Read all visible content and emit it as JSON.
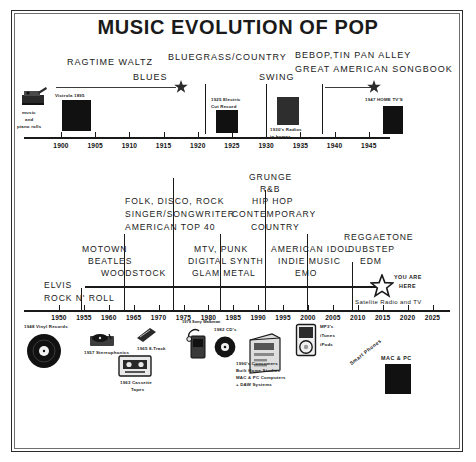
{
  "title": "MUSIC EVOLUTION OF POP",
  "chart_data": {
    "type": "timeline",
    "title": "MUSIC EVOLUTION OF POP",
    "grid": false,
    "legend": null,
    "timelines": [
      {
        "name": "early-era",
        "xlabel": "",
        "axis_ticks": [
          "1900",
          "1905",
          "1910",
          "1915",
          "1920",
          "1925",
          "1930",
          "1935",
          "1940",
          "1945"
        ],
        "xlim": [
          1895,
          1949
        ],
        "eras": [
          {
            "label": "RAGTIME WALTZ BLUES",
            "start": 1896,
            "end": 1920
          },
          {
            "label": "BLUEGRASS/COUNTRY",
            "start": 1920,
            "end": 1930
          },
          {
            "label": "SWING",
            "start": 1930,
            "end": 1939
          },
          {
            "label": "BEBOP,TIN PAN ALLEY GREAT AMERICAN SONGBOOK",
            "start": 1939,
            "end": 1948
          }
        ],
        "annotations": [
          {
            "label": "music and piano rolls",
            "year": 1895
          },
          {
            "label": "Victrola 1895",
            "year": 1897
          },
          {
            "label": "1925 Electric Cut Record",
            "year": 1925
          },
          {
            "label": "1930's Radios in homes",
            "year": 1933
          },
          {
            "label": "1947 HOME TV'S",
            "year": 1947
          }
        ]
      },
      {
        "name": "modern-era",
        "xlabel": "",
        "axis_ticks": [
          "1950",
          "1955",
          "1960",
          "1965",
          "1970",
          "1975",
          "1980",
          "1985",
          "1990",
          "1995",
          "2000",
          "2005",
          "2010",
          "2015",
          "2020",
          "2025"
        ],
        "xlim": [
          1947,
          2027
        ],
        "eras": [
          {
            "label": "ELVIS ROCK N' ROLL",
            "start": 1950,
            "end": 1957
          },
          {
            "label": "MOTOWN BEATLES WOODSTOCK",
            "start": 1957,
            "end": 1968
          },
          {
            "label": "FOLK, DISCO, ROCK SINGER/SONGWRITER AMERICAN TOP 40",
            "start": 1968,
            "end": 1977
          },
          {
            "label": "MTV, PUNK DIGITAL SYNTH GLAM METAL",
            "start": 1977,
            "end": 1988
          },
          {
            "label": "GRUNGE R&B HIP HOP CONTEMPORARY COUNTRY",
            "start": 1988,
            "end": 1999
          },
          {
            "label": "AMERICAN IDOL INDIE MUSIC EMO",
            "start": 1999,
            "end": 2010
          },
          {
            "label": "REGGAETONE DUBSTEP EDM",
            "start": 2010,
            "end": 2025
          }
        ],
        "annotations": [
          {
            "label": "1948 Vinyl Records",
            "year": 1948
          },
          {
            "label": "1957 Stereophonics",
            "year": 1957
          },
          {
            "label": "1963 Cassette Tapes",
            "year": 1963
          },
          {
            "label": "1965 8-Track",
            "year": 1965
          },
          {
            "label": "1979 Sony Walkman",
            "year": 1979
          },
          {
            "label": "1982 CD's",
            "year": 1982
          },
          {
            "label": "1990's Consumers Built Home Studios MAC & PC Computers + DAW Systems",
            "year": 1992
          },
          {
            "label": "MP3's iTunes iPods",
            "year": 2003
          },
          {
            "label": "Smart Phones",
            "year": 2012
          },
          {
            "label": "MAC & PC",
            "year": 2015
          },
          {
            "label": "Satelite Radio and TV",
            "year": 2017
          },
          {
            "label": "YOU ARE HERE",
            "year": 2020
          }
        ]
      }
    ]
  },
  "top": {
    "eras": {
      "ragtime_line1": "RAGTIME WALTZ",
      "ragtime_line2": "BLUES",
      "bluegrass": "BLUEGRASS/COUNTRY",
      "swing": "SWING",
      "bebop_line1": "BEBOP,TIN PAN ALLEY",
      "bebop_line2": "GREAT AMERICAN SONGBOOK"
    },
    "captions": {
      "music_rolls_l1": "music",
      "music_rolls_l2": "and",
      "music_rolls_l3": "piano rolls",
      "victrola": "Victrola 1895",
      "electric_cut_l1": "1925 Electric",
      "electric_cut_l2": "Cut Record",
      "radios_l1": "1930's Radios",
      "radios_l2": "in homes",
      "home_tv": "1947 HOME TV'S"
    },
    "years": [
      "1900",
      "1905",
      "1910",
      "1915",
      "1920",
      "1925",
      "1930",
      "1935",
      "1940",
      "1945"
    ]
  },
  "bottom": {
    "eras": {
      "elvis_l1": "ELVIS",
      "elvis_l2": "ROCK N' ROLL",
      "motown_l1": "MOTOWN",
      "motown_l2": "BEATLES",
      "motown_l3": "WOODSTOCK",
      "folk_l1": "FOLK, DISCO, ROCK",
      "folk_l2": "SINGER/SONGWRITER",
      "folk_l3": "AMERICAN TOP 40",
      "mtv_l1": "MTV, PUNK",
      "mtv_l2": "DIGITAL SYNTH",
      "mtv_l3": "GLAM METAL",
      "grunge_l1": "GRUNGE",
      "grunge_l2": "R&B",
      "grunge_l3": "HIP HOP",
      "grunge_l4": "CONTEMPORARY",
      "grunge_l5": "COUNTRY",
      "idol_l1": "AMERICAN IDOL",
      "idol_l2": "INDIE MUSIC",
      "idol_l3": "EMO",
      "reg_l1": "REGGAETONE",
      "reg_l2": "DUBSTEP",
      "reg_l3": "EDM",
      "you_are_here_l1": "YOU ARE",
      "you_are_here_l2": "HERE",
      "satellite": "Satelite Radio and TV"
    },
    "captions": {
      "vinyl": "1948 Vinyl Records",
      "stereo": "1957 Stereophonics",
      "cassette_l1": "1963 Cassette",
      "cassette_l2": "Tapes",
      "eight_track": "1965 8-Track",
      "walkman": "1979 Sony Walkman",
      "cds": "1982 CD's",
      "consumers_l1": "1990's Consumers",
      "consumers_l2": "Built Home Studios",
      "consumers_l3": "MAC & PC Computers",
      "consumers_l4": "+ DAW Systems",
      "mp3_l1": "MP3's",
      "mp3_l2": "iTunes",
      "mp3_l3": "iPods",
      "smartphones": "Smart Phones",
      "macpc": "MAC & PC"
    },
    "years": [
      "1950",
      "1955",
      "1960",
      "1965",
      "1970",
      "1975",
      "1980",
      "1985",
      "1990",
      "1995",
      "2000",
      "2005",
      "2010",
      "2015",
      "2020",
      "2025"
    ]
  },
  "colors": {
    "ink": "#1a1a1a",
    "frame": "#2b2b2b",
    "frame_inner": "#6f6f6f"
  }
}
